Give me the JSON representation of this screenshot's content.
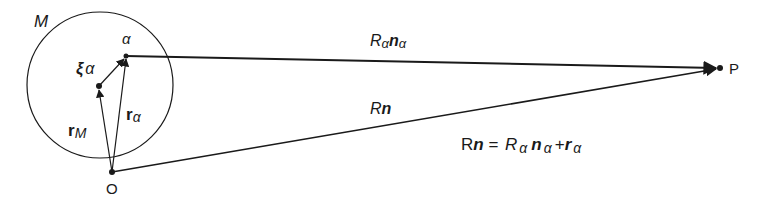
{
  "diagram": {
    "labels": {
      "body": "M",
      "particle": "α",
      "xi_sym": "ξ",
      "xi_sub": "α",
      "rM_sym": "r",
      "rM_sub": "M",
      "ralpha_sym": "r",
      "ralpha_sub": "α",
      "origin": "O",
      "point": "P",
      "Ralpha_R": "R",
      "Ralpha_sub1": "α",
      "Ralpha_n": "n",
      "Ralpha_sub2": "α",
      "Rn_R": "R",
      "Rn_n": "n"
    },
    "equation": {
      "lhs_R": "R",
      "lhs_n": "n",
      "eq": " = ",
      "R": "R",
      "R_sub": "α",
      "n": "n",
      "n_sub": "α",
      "plus": "+",
      "r": "r",
      "r_sub": "α"
    },
    "colors": {
      "ink": "#1a1a1a",
      "background": "#ffffff"
    }
  }
}
